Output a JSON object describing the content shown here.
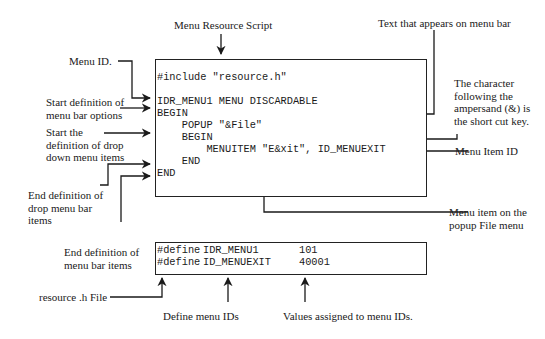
{
  "title": "Menu Resource Script",
  "resource_script": {
    "lines": [
      "#include \"resource.h\"",
      "IDR_MENU1 MENU DISCARDABLE",
      "BEGIN",
      "    POPUP \"&File\"",
      "    BEGIN",
      "        MENUITEM \"E&xit\", ID_MENUEXIT",
      "    END",
      "END"
    ]
  },
  "header_file": {
    "rows": [
      {
        "directive": "#define",
        "name": "IDR_MENU1",
        "value": "101"
      },
      {
        "directive": "#define",
        "name": "ID_MENUEXIT",
        "value": "40001"
      }
    ]
  },
  "annotations": {
    "menu_id": "Menu ID.",
    "start_menu_bar": [
      "Start definition of",
      "menu bar options"
    ],
    "start_drop_down": [
      "Start the",
      "definition of drop",
      "down menu items"
    ],
    "end_drop_menu": [
      "End definition of",
      "drop menu bar",
      "items"
    ],
    "end_menu_bar": [
      "End definition of",
      "menu bar items"
    ],
    "text_on_menu_bar": "Text that appears on menu bar",
    "shortcut_key": [
      "The character",
      "following the",
      "ampersand (&) is",
      "the short cut key."
    ],
    "menu_item_id": "Menu Item ID",
    "menu_item_popup": [
      "Menu item on the",
      "popup File menu"
    ],
    "resource_h_file": "resource .h File",
    "define_menu_ids": "Define menu IDs",
    "values_assigned": "Values assigned to menu IDs."
  }
}
